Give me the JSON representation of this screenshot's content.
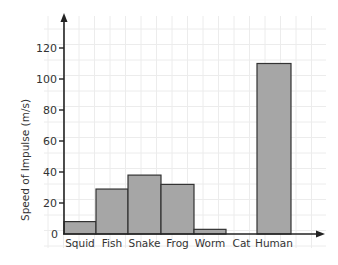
{
  "chart_data": {
    "type": "bar",
    "title": "",
    "xlabel": "",
    "ylabel": "Speed of Impulse (m/s)",
    "categories": [
      "Squid",
      "Fish",
      "Snake",
      "Frog",
      "Worm",
      "Cat",
      "Human"
    ],
    "values": [
      8,
      29,
      38,
      32,
      3,
      0,
      110
    ],
    "ylim": [
      0,
      130
    ],
    "yticks": [
      0,
      20,
      40,
      60,
      80,
      100,
      120
    ],
    "grid": true,
    "legend": null,
    "bar_color": "#a6a6a6",
    "bar_edge_color": "#333333",
    "grid_color": "#ececec"
  }
}
